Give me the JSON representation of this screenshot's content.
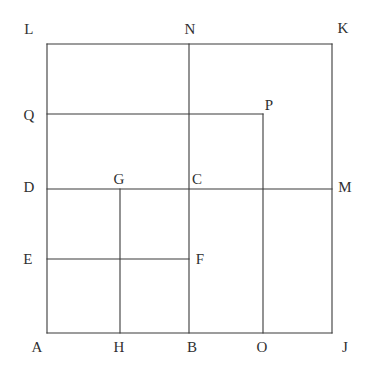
{
  "figure": {
    "background_color": "#ffffff",
    "stroke_color": "#3a3a3a",
    "stroke_width": 1.1,
    "label_color": "#2f2f2f",
    "view": {
      "width": 371,
      "height": 378
    },
    "bounds": {
      "left": 47,
      "right": 332,
      "top": 44,
      "bottom": 333
    },
    "guides": {
      "vertical_h": 120,
      "vertical_b": 189,
      "vertical_o": 263,
      "horizontal_q": 114,
      "horizontal_d": 189,
      "horizontal_e": 259
    },
    "segments": [
      {
        "name": "square-top-LK",
        "x1": 47,
        "y1": 44,
        "x2": 332,
        "y2": 44
      },
      {
        "name": "square-right-KJ",
        "x1": 332,
        "y1": 44,
        "x2": 332,
        "y2": 333
      },
      {
        "name": "square-bottom-AJ",
        "x1": 47,
        "y1": 333,
        "x2": 332,
        "y2": 333
      },
      {
        "name": "square-left-AL",
        "x1": 47,
        "y1": 44,
        "x2": 47,
        "y2": 333
      },
      {
        "name": "vertical-N-B",
        "x1": 189,
        "y1": 44,
        "x2": 189,
        "y2": 333
      },
      {
        "name": "vertical-G-H",
        "x1": 120,
        "y1": 189,
        "x2": 120,
        "y2": 333
      },
      {
        "name": "vertical-P-O",
        "x1": 263,
        "y1": 114,
        "x2": 263,
        "y2": 333
      },
      {
        "name": "horizontal-Q-P",
        "x1": 47,
        "y1": 114,
        "x2": 263,
        "y2": 114
      },
      {
        "name": "horizontal-D-M",
        "x1": 47,
        "y1": 189,
        "x2": 332,
        "y2": 189
      },
      {
        "name": "horizontal-E-F",
        "x1": 47,
        "y1": 259,
        "x2": 189,
        "y2": 259
      }
    ],
    "labels": [
      {
        "id": "L",
        "text": "L",
        "x": 29,
        "y": 29
      },
      {
        "id": "N",
        "text": "N",
        "x": 190,
        "y": 29
      },
      {
        "id": "K",
        "text": "K",
        "x": 343,
        "y": 28
      },
      {
        "id": "Q",
        "text": "Q",
        "x": 29,
        "y": 115
      },
      {
        "id": "P",
        "text": "P",
        "x": 269,
        "y": 105
      },
      {
        "id": "D",
        "text": "D",
        "x": 29,
        "y": 187
      },
      {
        "id": "G",
        "text": "G",
        "x": 119,
        "y": 179
      },
      {
        "id": "C",
        "text": "C",
        "x": 197,
        "y": 179
      },
      {
        "id": "M",
        "text": "M",
        "x": 345,
        "y": 187
      },
      {
        "id": "E",
        "text": "E",
        "x": 28,
        "y": 259
      },
      {
        "id": "F",
        "text": "F",
        "x": 200,
        "y": 259
      },
      {
        "id": "A",
        "text": "A",
        "x": 37,
        "y": 347
      },
      {
        "id": "H",
        "text": "H",
        "x": 119,
        "y": 347
      },
      {
        "id": "B",
        "text": "B",
        "x": 192,
        "y": 347
      },
      {
        "id": "O",
        "text": "O",
        "x": 262,
        "y": 347
      },
      {
        "id": "J",
        "text": "J",
        "x": 345,
        "y": 347
      }
    ]
  }
}
